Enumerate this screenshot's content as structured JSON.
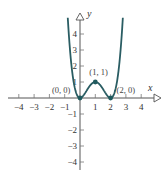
{
  "chart_data": {
    "type": "line",
    "title": "",
    "function": "y = x^2 (x - 2)^2",
    "xlabel": "x",
    "ylabel": "y",
    "xlim": [
      -4.6,
      5.1
    ],
    "ylim": [
      -4.5,
      5.3
    ],
    "x_ticks": [
      -4,
      -3,
      -2,
      -1,
      1,
      2,
      3,
      4
    ],
    "x_tick_labels": [
      "−4",
      "−3",
      "−2",
      "−1",
      "1",
      "2",
      "3",
      "4"
    ],
    "y_ticks": [
      4,
      3,
      2,
      1,
      -1,
      -2,
      -3,
      -4
    ],
    "y_tick_labels": [
      "4",
      "3",
      "2",
      "1",
      "−1",
      "−2",
      "−3",
      "−4"
    ],
    "grid": false,
    "legend": null,
    "series": [
      {
        "name": "f(x)",
        "x": [
          -0.8,
          -0.6,
          -0.4,
          -0.2,
          0,
          0.2,
          0.4,
          0.6,
          0.8,
          1,
          1.2,
          1.4,
          1.6,
          1.8,
          2,
          2.2,
          2.4,
          2.6,
          2.8
        ],
        "y": [
          5.02,
          2.43,
          0.92,
          0.19,
          0,
          0.13,
          0.41,
          0.71,
          0.92,
          1,
          0.92,
          0.71,
          0.41,
          0.13,
          0,
          0.19,
          0.92,
          2.43,
          5.02
        ],
        "color": "#2a5d63"
      }
    ],
    "points": [
      {
        "x": 0,
        "y": 0,
        "label": "(0, 0)"
      },
      {
        "x": 1,
        "y": 1,
        "label": "(1, 1)"
      },
      {
        "x": 2,
        "y": 0,
        "label": "(2, 0)"
      }
    ]
  },
  "colors": {
    "curve": "#2a5d63",
    "point": "#1f5a5e",
    "axis": "#555555"
  }
}
